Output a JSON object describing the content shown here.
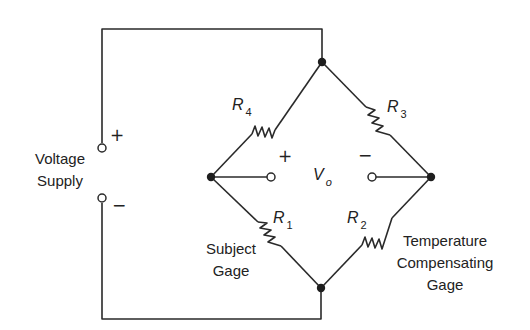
{
  "diagram": {
    "supply": {
      "label_line1": "Voltage",
      "label_line2": "Supply",
      "plus": "+",
      "minus": "−"
    },
    "output": {
      "symbol": "V",
      "subscript": "o",
      "plus": "+",
      "minus": "−"
    },
    "resistors": [
      {
        "id": "R1",
        "symbol": "R",
        "subscript": "1",
        "note_line1": "Subject",
        "note_line2": "Gage"
      },
      {
        "id": "R2",
        "symbol": "R",
        "subscript": "2",
        "note_line1": "Temperature",
        "note_line2": "Compensating",
        "note_line3": "Gage"
      },
      {
        "id": "R3",
        "symbol": "R",
        "subscript": "3"
      },
      {
        "id": "R4",
        "symbol": "R",
        "subscript": "4"
      }
    ],
    "colors": {
      "line": "#2a2a2a",
      "background": "#ffffff"
    }
  }
}
